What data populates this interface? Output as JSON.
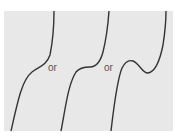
{
  "diagram": {
    "background_color": "#e8e8e8",
    "curve_color": "#333333",
    "curves": [
      {
        "name": "increasing-inflection",
        "shape": "monotonic increasing with gentle inflection"
      },
      {
        "name": "stationary-inflection",
        "shape": "monotonic increasing with flat stationary inflection"
      },
      {
        "name": "local-max-min",
        "shape": "increasing with local maximum and local minimum"
      }
    ],
    "separators": [
      "or",
      "or"
    ]
  }
}
